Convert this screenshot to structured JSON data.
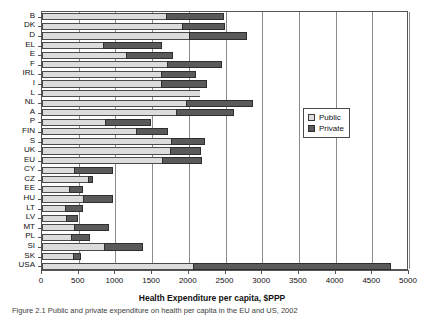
{
  "chart_data": {
    "type": "bar",
    "orientation": "horizontal",
    "stacked": true,
    "title": "",
    "xlabel": "Health Expenditure per capita, $PPP",
    "ylabel": "",
    "xlim": [
      0,
      5000
    ],
    "xticks": [
      0,
      500,
      1000,
      1500,
      2000,
      2500,
      3000,
      3500,
      4000,
      4500,
      5000
    ],
    "xticklabels": [
      "0",
      "500",
      "1000",
      "1500",
      "2000",
      "2500",
      "3000",
      "3500",
      "4000",
      "4500",
      "5000"
    ],
    "grid": "vertical",
    "legend_position": "center-right",
    "categories": [
      "B",
      "DK",
      "D",
      "EL",
      "E",
      "F",
      "IRL",
      "I",
      "L",
      "NL",
      "A",
      "P",
      "FIN",
      "S",
      "UK",
      "EU",
      "CY",
      "CZ",
      "EE",
      "HU",
      "LT",
      "LV",
      "MT",
      "PL",
      "SI",
      "SK",
      "USA"
    ],
    "series": [
      {
        "name": "Public",
        "color": "#dcdcdc",
        "values": [
          1690,
          1910,
          2000,
          830,
          1150,
          1700,
          1620,
          1620,
          2155,
          1960,
          1830,
          860,
          1280,
          1760,
          1740,
          1640,
          440,
          620,
          370,
          560,
          310,
          330,
          440,
          400,
          850,
          420,
          2055
        ]
      },
      {
        "name": "Private",
        "color": "#5a5a5a",
        "values": [
          790,
          585,
          790,
          800,
          630,
          755,
          480,
          630,
          0,
          915,
          790,
          630,
          440,
          460,
          420,
          540,
          530,
          70,
          190,
          410,
          250,
          160,
          470,
          250,
          530,
          115,
          2700
        ]
      }
    ],
    "totals": [
      2480,
      2495,
      2790,
      1630,
      1780,
      2455,
      2100,
      2250,
      2155,
      2875,
      2620,
      1490,
      1720,
      2220,
      2160,
      2180,
      970,
      690,
      560,
      970,
      560,
      490,
      910,
      650,
      1380,
      535,
      4755
    ]
  },
  "legend": {
    "items": [
      {
        "label": "Public",
        "swatch": "light-gray-square"
      },
      {
        "label": "Private",
        "swatch": "dark-gray-square"
      }
    ]
  },
  "axis": {
    "x_title": "Health Expenditure per capita, $PPP"
  },
  "caption": {
    "text": "Figure 2.1  Public and private expenditure on health per capita in the EU and US, 2002"
  }
}
